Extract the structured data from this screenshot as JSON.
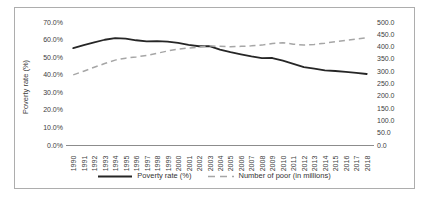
{
  "window": {
    "background": "#ffffff",
    "figure_border_color": "#adadad"
  },
  "chart_data": {
    "type": "line",
    "title": "",
    "x": [
      1990,
      1991,
      1992,
      1993,
      1994,
      1995,
      1996,
      1997,
      1998,
      1999,
      2000,
      2001,
      2002,
      2003,
      2004,
      2005,
      2006,
      2007,
      2008,
      2009,
      2010,
      2011,
      2012,
      2013,
      2014,
      2015,
      2016,
      2017,
      2018
    ],
    "series": [
      {
        "name": "Poverty rate (%)",
        "axis": "left",
        "line_style": "solid",
        "color": "#262626",
        "values": [
          55.1,
          56.9,
          58.4,
          59.9,
          60.8,
          60.5,
          59.6,
          59.0,
          59.1,
          58.8,
          58.1,
          57.0,
          56.2,
          56.3,
          54.3,
          52.8,
          51.6,
          50.4,
          49.4,
          49.5,
          48.0,
          46.2,
          44.3,
          43.5,
          42.5,
          42.1,
          41.6,
          41.0,
          40.4
        ]
      },
      {
        "name": "Number of poor (in millions)",
        "axis": "right",
        "line_style": "dashed",
        "color": "#a6a6a6",
        "values": [
          285,
          300,
          316,
          331,
          345,
          353,
          358,
          364,
          373,
          382,
          390,
          394,
          398,
          403,
          401,
          399,
          401,
          403,
          406,
          413,
          416,
          410,
          406,
          409,
          414,
          420,
          425,
          431,
          436
        ]
      }
    ],
    "left_axis": {
      "label": "Poverty rate (%)",
      "min": 0,
      "max": 70,
      "tick_labels": [
        "70.0%",
        "60.0%",
        "50.0%",
        "40.0%",
        "30.0%",
        "20.0%",
        "10.0%",
        "0.0%"
      ]
    },
    "right_axis": {
      "min": 0,
      "max": 500,
      "tick_labels": [
        "500.0",
        "450.0",
        "400.0",
        "350.0",
        "300.0",
        "250.0",
        "200.0",
        "150.0",
        "100.0",
        "50.0",
        "0.0"
      ]
    },
    "grid": false,
    "legend_position": "bottom",
    "x_tick_rotation": 90
  }
}
